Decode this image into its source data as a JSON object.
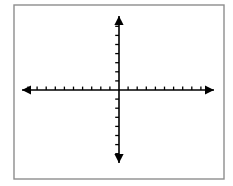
{
  "figure": {
    "width": 233,
    "height": 186,
    "background_color": "#ffffff"
  },
  "frame": {
    "name": "image-border",
    "x": 14,
    "y": 5,
    "width": 210,
    "height": 174,
    "stroke_color": "#8d8d8d",
    "stroke_width": 1.4
  },
  "chart_data": {
    "type": "scatter",
    "title": "",
    "subtitle": "",
    "xlabel": "",
    "ylabel": "",
    "grid": false,
    "legend": null,
    "series": [],
    "x": [],
    "values": [],
    "annotations": [],
    "origin": {
      "x": 119,
      "y": 90
    },
    "axis_color": "#000000",
    "axis_stroke_width": 1.6,
    "tick_stroke_width": 1.3,
    "tick_spacing_px": 9.1,
    "x_axis": {
      "name": "x-axis",
      "start_x": 22,
      "end_x": 214,
      "y": 90,
      "ticks_left": 10,
      "ticks_right": 9,
      "tick_length_up": 3.4,
      "tick_length_down": 0,
      "arrow_left": true,
      "arrow_right": true,
      "tick_labels": []
    },
    "y_axis": {
      "name": "y-axis",
      "x": 119,
      "start_y": 16,
      "end_y": 163,
      "ticks_up": 7,
      "ticks_down": 7,
      "tick_length_left": 3.8,
      "tick_length_right": 0,
      "arrow_up": true,
      "arrow_down": true,
      "tick_labels": []
    },
    "arrowheads": {
      "length": 9,
      "half_width": 4.6,
      "color": "#000000"
    }
  }
}
